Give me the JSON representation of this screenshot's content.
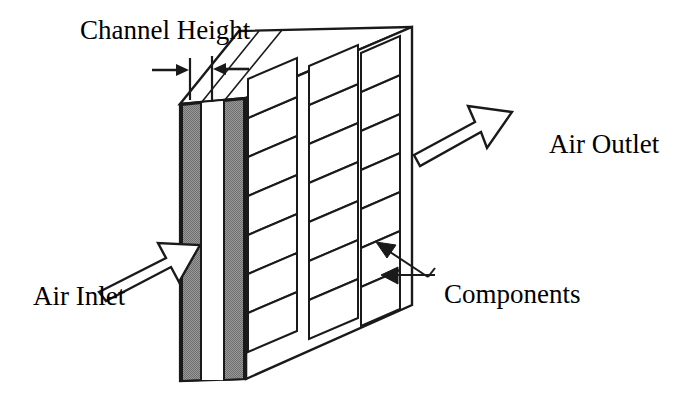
{
  "figure": {
    "kind": "isometric-line-drawing",
    "background_color": "#ffffff",
    "line_color": "#1a1a1a",
    "fill_gray": "#8a8a8a",
    "fill_white": "#ffffff"
  },
  "labels": {
    "channel_height": "Channel Height",
    "air_outlet": "Air Outlet",
    "air_inlet": "Air Inlet",
    "components": "Components"
  },
  "annotations": {
    "channel_height_icon": "dimension-arrows-icon",
    "air_inlet_icon": "block-arrow-right-up-icon",
    "air_outlet_icon": "block-arrow-right-up-icon",
    "components_icon": "leader-arrows-icon"
  },
  "geometry": {
    "board_component_columns": 3,
    "board_component_rows": 7,
    "channel_walls": 2,
    "channel_gap_label": "Channel Height"
  }
}
